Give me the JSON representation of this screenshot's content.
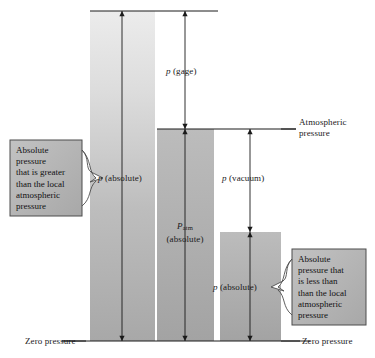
{
  "figure": {
    "background_color": "#ffffff",
    "line_color": "#1a1a1a",
    "text_color": "#1a1a1a",
    "callout_fill": "#b4b4b4",
    "callout_border": "#555555"
  },
  "bars": [
    {
      "id": "bar-absolute-high",
      "label": "p (absolute)",
      "label_italic_prefix": "p",
      "label_rest": " (absolute)",
      "fill_top": "#e8e8e8",
      "fill_bottom": "#a9a9a9",
      "x": 90,
      "width": 65,
      "top_y": 11,
      "bottom_y": 341
    },
    {
      "id": "bar-atmospheric",
      "label_line1": "P",
      "label_sub": "atm",
      "label_line2": "(absolute)",
      "fill_top": "#b8b8b8",
      "fill_bottom": "#a0a0a0",
      "x": 157,
      "width": 57,
      "top_y": 129,
      "bottom_y": 341
    },
    {
      "id": "bar-absolute-low",
      "label": "p (absolute)",
      "label_italic_prefix": "p",
      "label_rest": " (absolute)",
      "fill_top": "#b8b8b8",
      "fill_bottom": "#a0a0a0",
      "x": 220,
      "width": 61,
      "top_y": 232,
      "bottom_y": 341
    }
  ],
  "dimension_labels": {
    "p_gage": {
      "italic": "p",
      "rest": " (gage)"
    },
    "p_vacuum": {
      "italic": "p",
      "rest": " (vacuum)"
    },
    "p_absolute_left": {
      "italic": "p",
      "rest": " (absolute)"
    },
    "p_absolute_right": {
      "italic": "p",
      "rest": " (absolute)"
    },
    "p_atm_line1_italic": "P",
    "p_atm_subscript": "atm",
    "p_atm_line2": "(absolute)"
  },
  "reference_lines": {
    "atmospheric": "Atmospheric\npressure",
    "zero_pressure_left": "Zero pressure",
    "zero_pressure_right": "Zero pressure"
  },
  "callouts": [
    {
      "id": "callout-left",
      "text": "Absolute\npressure\nthat is greater\nthan the local\natmospheric\npressure",
      "points_to": "p (absolute)"
    },
    {
      "id": "callout-right",
      "text": "Absolute\npressure that\nis less than\nthan the local\natmospheric\npressure",
      "points_to": "p (absolute)"
    }
  ]
}
